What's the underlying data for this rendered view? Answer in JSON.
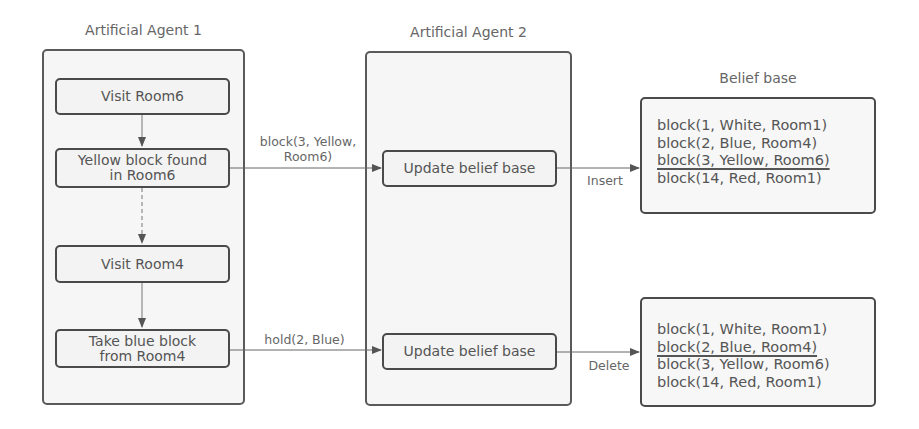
{
  "agent1": {
    "title": "Artificial Agent 1",
    "steps": [
      {
        "label": "Visit Room6"
      },
      {
        "label": "Yellow block found in Room6",
        "line1": "Yellow block found",
        "line2": "in Room6"
      },
      {
        "label": "Visit Room4"
      },
      {
        "label": "Take blue block from Room4",
        "line1": "Take blue block",
        "line2": "from Room4"
      }
    ]
  },
  "agent2": {
    "title": "Artificial Agent 2",
    "steps": [
      {
        "label": "Update belief base"
      },
      {
        "label": "Update belief base"
      }
    ]
  },
  "messages": [
    {
      "line1": "block(3, Yellow,",
      "line2": "Room6)"
    },
    {
      "line1": "hold(2, Blue)"
    }
  ],
  "operations": [
    {
      "label": "Insert"
    },
    {
      "label": "Delete"
    }
  ],
  "belief_bases": {
    "title": "Belief base",
    "insert": {
      "rows": [
        "block(1, White, Room1)",
        "block(2, Blue, Room4)",
        "block(3, Yellow, Room6)",
        "block(14, Red, Room1)"
      ],
      "highlighted_row": 2
    },
    "delete": {
      "rows": [
        "block(1, White, Room1)",
        "block(2, Blue, Room4)",
        "block(3, Yellow, Room6)",
        "block(14, Red, Room1)"
      ],
      "highlighted_row": 1
    }
  }
}
